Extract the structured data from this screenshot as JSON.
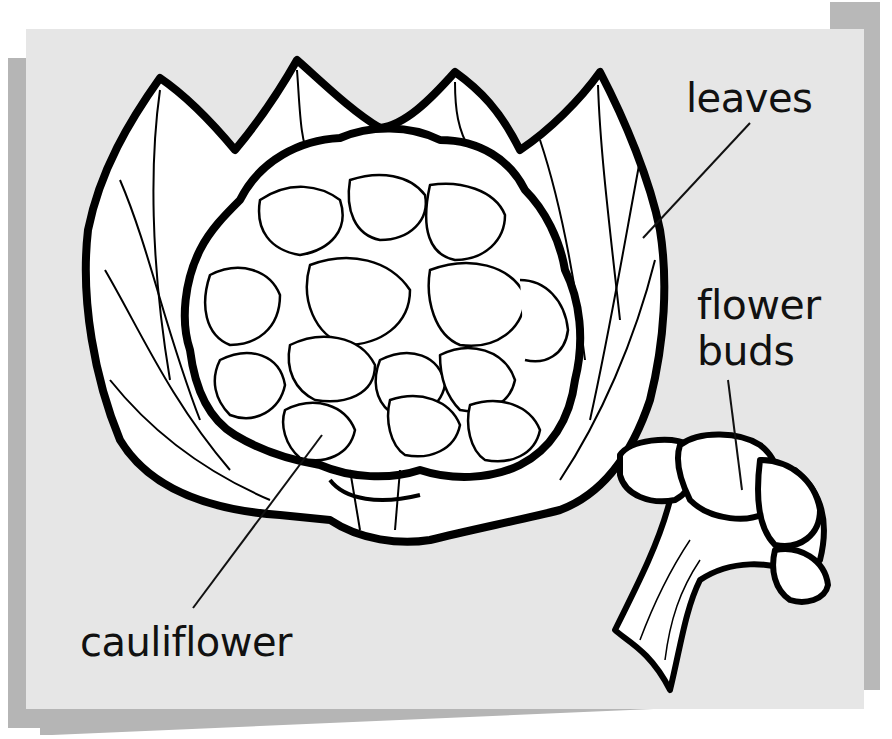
{
  "diagram": {
    "background_color": "#e6e6e6",
    "shadow_color": "#b3b3b3",
    "labels": {
      "leaves": "leaves",
      "flower_buds_line1": "flower",
      "flower_buds_line2": "buds",
      "cauliflower": "cauliflower"
    },
    "parts": [
      {
        "name": "leaves",
        "points_to": "outer leaves of cauliflower head"
      },
      {
        "name": "flower buds",
        "points_to": "floret of detached cauliflower piece"
      },
      {
        "name": "cauliflower",
        "points_to": "white curd of cauliflower head"
      }
    ]
  }
}
